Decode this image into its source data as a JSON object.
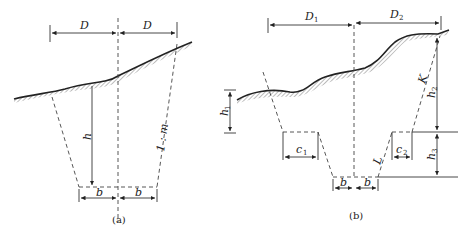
{
  "figure": {
    "panel_a": {
      "caption": "(a)",
      "labels": {
        "d_left": "D",
        "d_right": "D",
        "h": "h",
        "slope": "1 : m",
        "b_left": "b",
        "b_right": "b"
      }
    },
    "panel_b": {
      "caption": "(b)",
      "labels": {
        "d1": "D",
        "d1_sub": "1",
        "d2": "D",
        "d2_sub": "2",
        "h1": "h",
        "h1_sub": "1",
        "h2": "h",
        "h2_sub": "2",
        "h3": "h",
        "h3_sub": "3",
        "c1": "c",
        "c1_sub": "1",
        "c2": "c",
        "c2_sub": "2",
        "k": "K",
        "l": "L",
        "b_left": "b",
        "b_right": "b"
      }
    },
    "colors": {
      "line": "#333333",
      "hatch": "#555555"
    }
  }
}
